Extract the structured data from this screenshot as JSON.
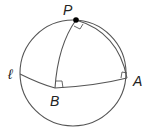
{
  "diagram": {
    "labels": {
      "pole": "P",
      "line": "ℓ",
      "point_a": "A",
      "point_b": "B"
    },
    "right_angles": [
      "at P between arcs PB and PA",
      "at B between PB and ℓ",
      "at A between PA and ℓ"
    ],
    "colors": {
      "stroke": "#555555",
      "point": "#000000",
      "text": "#222222"
    }
  }
}
